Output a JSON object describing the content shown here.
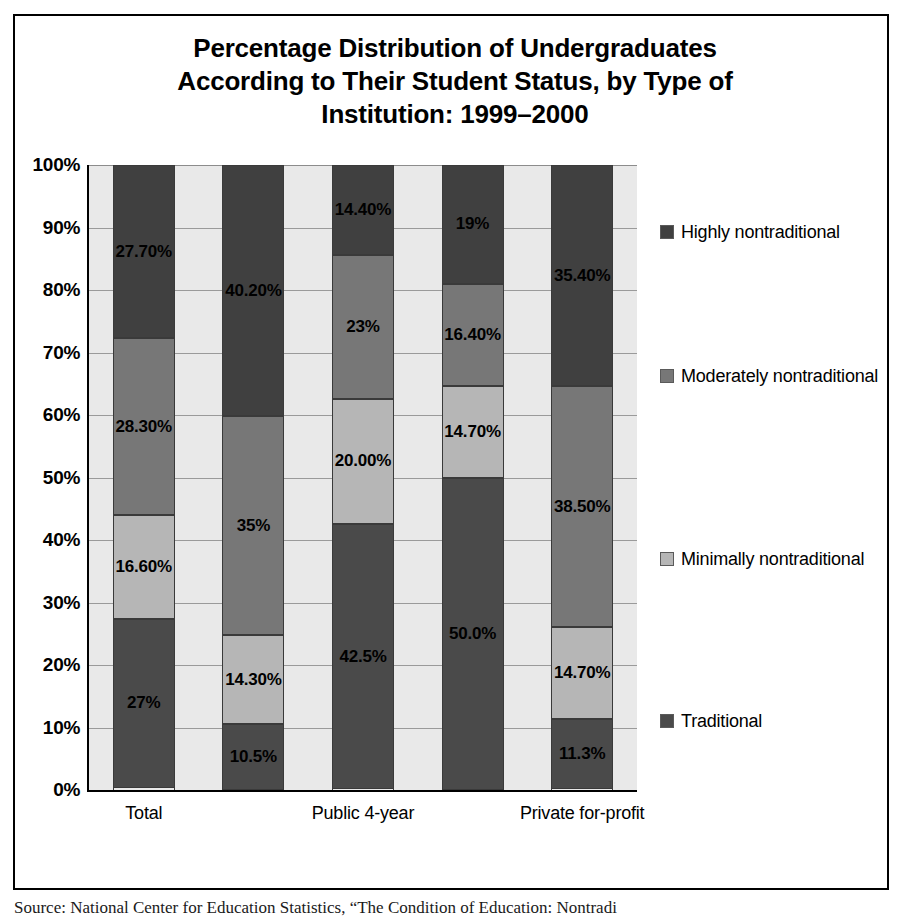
{
  "chart_data": {
    "type": "bar",
    "subtype": "100% stacked column",
    "title": "Percentage Distribution of Undergraduates According to Their Student Status, by Type of Institution: 1999–2000",
    "title_lines": [
      "Percentage Distribution of Undergraduates",
      "According to Their Student Status, by Type of",
      "Institution: 1999–2000"
    ],
    "xlabel": "",
    "ylabel": "",
    "ylim": [
      0,
      100
    ],
    "grid": true,
    "legend_position": "right",
    "ytick_labels": [
      "100%",
      "90%",
      "80%",
      "70%",
      "60%",
      "50%",
      "40%",
      "30%",
      "20%",
      "10%",
      "0%"
    ],
    "ytick_values": [
      100,
      90,
      80,
      70,
      60,
      50,
      40,
      30,
      20,
      10,
      0
    ],
    "categories": [
      "Total",
      "",
      "Public 4-year",
      "",
      "Private for-profit"
    ],
    "category_labels_shown": [
      "Total",
      "Public 4-year",
      "Private for-profit"
    ],
    "series": [
      {
        "name": "Traditional",
        "color": "#4a4a4a",
        "values": [
          27.0,
          10.5,
          42.5,
          50.0,
          11.3
        ],
        "labels": [
          "27%",
          "10.5%",
          "42.5%",
          "50.0%",
          "11.3%"
        ]
      },
      {
        "name": "Minimally nontraditional",
        "color": "#b6b6b6",
        "values": [
          16.6,
          14.3,
          20.0,
          14.7,
          14.7
        ],
        "labels": [
          "16.60%",
          "14.30%",
          "20.00%",
          "14.70%",
          "14.70%"
        ]
      },
      {
        "name": "Moderately nontraditional",
        "color": "#777777",
        "values": [
          28.3,
          35.0,
          23.0,
          16.4,
          38.5
        ],
        "labels": [
          "28.30%",
          "35%",
          "23%",
          "16.40%",
          "38.50%"
        ]
      },
      {
        "name": "Highly nontraditional",
        "color": "#404040",
        "values": [
          27.7,
          40.2,
          14.4,
          19.0,
          35.4
        ],
        "labels": [
          "27.70%",
          "40.20%",
          "14.40%",
          "19%",
          "35.40%"
        ]
      }
    ],
    "legend_entries": [
      {
        "label": "Highly nontraditional",
        "color": "#404040"
      },
      {
        "label": "Moderately nontraditional",
        "color": "#777777"
      },
      {
        "label": "Minimally nontraditional",
        "color": "#b6b6b6"
      },
      {
        "label": "Traditional",
        "color": "#4a4a4a"
      }
    ]
  },
  "source_note": "Source: National Center for Education Statistics, “The Condition of Education: Nontradi"
}
